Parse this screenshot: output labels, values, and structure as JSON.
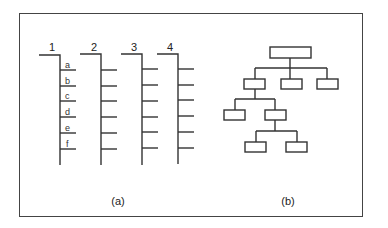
{
  "figure": {
    "panel_a": {
      "caption": "(a)",
      "columns": [
        {
          "label": "1",
          "rung_labels": [
            "a",
            "b",
            "c",
            "d",
            "e",
            "f"
          ]
        },
        {
          "label": "2",
          "rung_labels": []
        },
        {
          "label": "3",
          "rung_labels": []
        },
        {
          "label": "4",
          "rung_labels": []
        }
      ],
      "rungs_per_column": 6
    },
    "panel_b": {
      "caption": "(b)",
      "tree": {
        "description": "hierarchical tree of unlabeled boxes",
        "root": {
          "children": [
            {
              "children": [
                {
                  "children": []
                },
                {
                  "children": [
                    {
                      "children": []
                    },
                    {
                      "children": []
                    }
                  ]
                }
              ]
            },
            {
              "children": []
            },
            {
              "children": []
            }
          ]
        }
      }
    },
    "colors": {
      "stroke": "#333333",
      "background": "#ffffff"
    }
  }
}
